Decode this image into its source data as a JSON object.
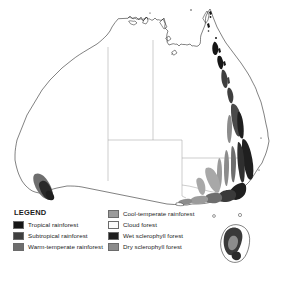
{
  "figure": {
    "type": "thematic-map",
    "region": "Australia",
    "background_color": "#ffffff",
    "outline_color": "#1a1a1a",
    "border_color": "#9a9a9a"
  },
  "legend": {
    "title": "LEGEND",
    "columns": [
      {
        "items": [
          {
            "label": "Tropical rainforest",
            "color": "#161616",
            "swatch_border": "#6b6b6b"
          },
          {
            "label": "Subtropical rainforest",
            "color": "#3f3f3f",
            "swatch_border": "#6b6b6b"
          },
          {
            "label": "Warm-temperate rainforest",
            "color": "#6e6e6e",
            "swatch_border": "#6b6b6b"
          }
        ]
      },
      {
        "items": [
          {
            "label": "Cool-temperate rainforest",
            "color": "#9b9b9b",
            "swatch_border": "#6b6b6b"
          },
          {
            "label": "Cloud forest",
            "color": "#fbfbfb",
            "swatch_border": "#6b6b6b"
          },
          {
            "label": "Wet sclerophyll forest",
            "color": "#1f1f1f",
            "swatch_border": "#6b6b6b"
          },
          {
            "label": "Dry sclerophyll forest",
            "color": "#8c8c8c",
            "swatch_border": "#6b6b6b"
          }
        ]
      }
    ]
  },
  "map": {
    "landmasses": [
      {
        "name": "mainland-australia"
      },
      {
        "name": "tasmania"
      }
    ],
    "state_borders_visible": true,
    "forest_regions": [
      {
        "name": "cape-york-tropical-rainforest",
        "tone": "#161616"
      },
      {
        "name": "queensland-wet-tropics",
        "tone": "#161616"
      },
      {
        "name": "central-queensland-coast",
        "tone": "#3f3f3f"
      },
      {
        "name": "southeast-queensland-subtropical",
        "tone": "#3f3f3f"
      },
      {
        "name": "new-south-wales-great-dividing-range",
        "tone": "#2a2a2a"
      },
      {
        "name": "nsw-inland-dry-sclerophyll",
        "tone": "#8c8c8c"
      },
      {
        "name": "victoria-wet-sclerophyll",
        "tone": "#2a2a2a"
      },
      {
        "name": "victoria-cool-temperate",
        "tone": "#9b9b9b"
      },
      {
        "name": "tasmania-forests",
        "tone": "#4a4a4a"
      },
      {
        "name": "southwest-western-australia",
        "tone": "#3a3a3a"
      }
    ]
  }
}
